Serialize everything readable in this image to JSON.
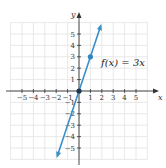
{
  "chart_data": {
    "type": "line",
    "title": "",
    "xlabel": "x",
    "ylabel": "y",
    "xlim": [
      -5.5,
      5.5
    ],
    "ylim": [
      -5.5,
      5.5
    ],
    "grid": true,
    "x_ticks": [
      -5,
      -4,
      -3,
      -2,
      -1,
      1,
      2,
      3,
      4,
      5
    ],
    "y_ticks": [
      -5,
      -4,
      -3,
      -2,
      -1,
      1,
      2,
      3,
      4,
      5
    ],
    "series": [
      {
        "name": "f(x) = 3x",
        "function": "3x",
        "line_from": [
          -1.9,
          -5.7
        ],
        "line_to": [
          1.9,
          5.7
        ],
        "arrows": "both",
        "points": [
          {
            "x": 0,
            "y": 0
          },
          {
            "x": 1,
            "y": 3
          }
        ],
        "color": "#3a8fc8"
      }
    ],
    "annotations": [
      {
        "text": "f(x) = 3x",
        "x": 2.6,
        "y": 2.6
      }
    ]
  },
  "colors": {
    "line": "#3a8fc8",
    "point": "#2f86c0",
    "origin_point": "#1f3550",
    "grid": "#e2e2e2",
    "axis": "#333333"
  }
}
